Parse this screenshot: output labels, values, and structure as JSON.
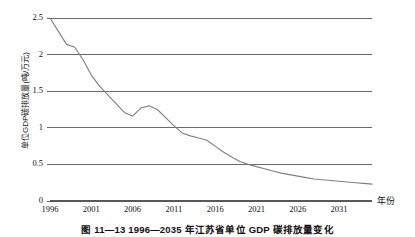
{
  "figure": {
    "caption": "图 11—13  1996—2035 年江苏省单位 GDP 碳排放量变化"
  },
  "axes": {
    "y_title": "单位GDP碳排放量(吨/万元)",
    "x_title": "年份",
    "y_ticks": [
      "0",
      "0.5",
      "1",
      "1.5",
      "2",
      "2.5"
    ],
    "x_ticks": [
      "1996",
      "2001",
      "2006",
      "2011",
      "2016",
      "2021",
      "2026",
      "2031"
    ]
  },
  "colors": {
    "line": "#808080",
    "grid": "#595959",
    "text": "#111111",
    "background": "#ffffff"
  },
  "chart_data": {
    "type": "line",
    "title": "图 11—13  1996—2035 年江苏省单位 GDP 碳排放量变化",
    "xlabel": "年份",
    "ylabel": "单位GDP碳排放量(吨/万元)",
    "xlim": [
      1996,
      2035
    ],
    "ylim": [
      0,
      2.5
    ],
    "grid": true,
    "legend": "none",
    "x_tick_labels": [
      "1996",
      "2001",
      "2006",
      "2011",
      "2016",
      "2021",
      "2026",
      "2031"
    ],
    "y_tick_labels": [
      "0",
      "0.5",
      "1",
      "1.5",
      "2",
      "2.5"
    ],
    "series": [
      {
        "name": "单位GDP碳排放量",
        "x": [
          1996,
          1997,
          1998,
          1999,
          2000,
          2001,
          2002,
          2003,
          2004,
          2005,
          2006,
          2007,
          2008,
          2009,
          2010,
          2011,
          2012,
          2013,
          2014,
          2015,
          2016,
          2017,
          2018,
          2019,
          2020,
          2021,
          2022,
          2023,
          2024,
          2025,
          2026,
          2027,
          2028,
          2029,
          2030,
          2031,
          2032,
          2033,
          2034,
          2035
        ],
        "values": [
          2.5,
          2.32,
          2.14,
          2.1,
          1.93,
          1.72,
          1.57,
          1.45,
          1.33,
          1.21,
          1.16,
          1.27,
          1.3,
          1.25,
          1.14,
          1.03,
          0.93,
          0.89,
          0.86,
          0.83,
          0.75,
          0.67,
          0.6,
          0.54,
          0.5,
          0.47,
          0.44,
          0.41,
          0.38,
          0.36,
          0.34,
          0.32,
          0.3,
          0.29,
          0.28,
          0.27,
          0.26,
          0.25,
          0.24,
          0.23
        ]
      }
    ]
  }
}
